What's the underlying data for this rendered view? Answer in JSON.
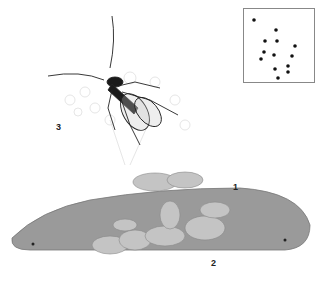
{
  "illustration": {
    "subject": "parasitic wasp with host caterpillar and larvae",
    "labels": [
      {
        "id": "1",
        "text": "1",
        "x": 233,
        "y": 182
      },
      {
        "id": "2",
        "text": "2",
        "x": 211,
        "y": 258
      },
      {
        "id": "3",
        "text": "3",
        "x": 56,
        "y": 122
      }
    ]
  },
  "range_map": {
    "region": "North America",
    "dots": [
      [
        254,
        20
      ],
      [
        276,
        30
      ],
      [
        265,
        41
      ],
      [
        277,
        41
      ],
      [
        295,
        46
      ],
      [
        264,
        52
      ],
      [
        274,
        55
      ],
      [
        292,
        56
      ],
      [
        261,
        59
      ],
      [
        288,
        66
      ],
      [
        275,
        69
      ],
      [
        288,
        72
      ],
      [
        278,
        78
      ]
    ],
    "dot_color": "#111111",
    "border_color": "#888888"
  },
  "colors": {
    "background": "#ffffff",
    "caterpillar": "#9a9a9a",
    "larvae": "#c4c4c4",
    "wasp_body": "#1a1a1a"
  }
}
